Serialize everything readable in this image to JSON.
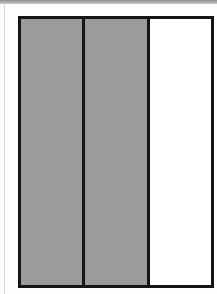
{
  "diagram": {
    "type": "fraction-bar",
    "orientation": "vertical-partitions",
    "total_parts": 3,
    "shaded_parts": 2,
    "parts": [
      {
        "index": 0,
        "shaded": true
      },
      {
        "index": 1,
        "shaded": true
      },
      {
        "index": 2,
        "shaded": false
      }
    ],
    "colors": {
      "shaded": "#9b9b9b",
      "unshaded": "#ffffff",
      "border": "#151515"
    }
  }
}
